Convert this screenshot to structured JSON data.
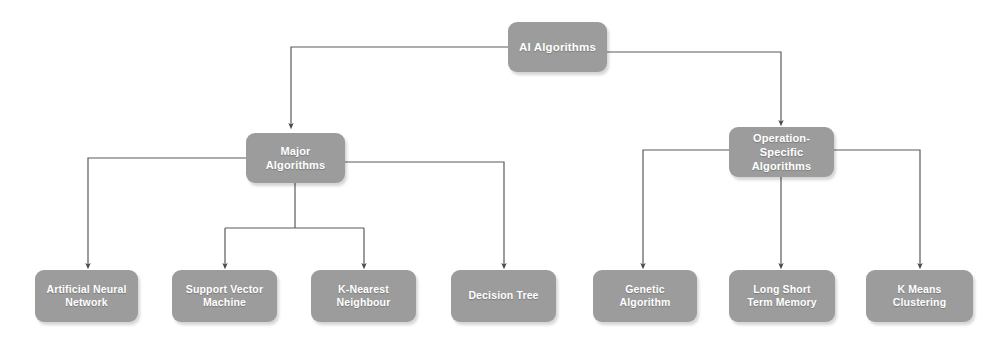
{
  "diagram": {
    "type": "tree",
    "background_color": "#ffffff",
    "node_color": "#9c9c9c",
    "node_text_color": "#ffffff",
    "connector_color": "#5a5a5a",
    "nodes": {
      "root": {
        "label": "AI Algorithms",
        "level": 0
      },
      "major": {
        "label": "Major Algorithms",
        "level": 1
      },
      "operation": {
        "label": "Operation- Specific\nAlgorithms",
        "level": 1
      },
      "ann": {
        "label": "Artificial Neural\nNetwork",
        "level": 2
      },
      "svm": {
        "label": "Support Vector\nMachine",
        "level": 2
      },
      "knn": {
        "label": "K-Nearest\nNeighbour",
        "level": 2
      },
      "dtree": {
        "label": "Decision Tree",
        "level": 2
      },
      "genetic": {
        "label": "Genetic\nAlgorithm",
        "level": 2
      },
      "lstm": {
        "label": "Long Short\nTerm Memory",
        "level": 2
      },
      "kmeans": {
        "label": "K Means\nClustering",
        "level": 2
      }
    }
  }
}
